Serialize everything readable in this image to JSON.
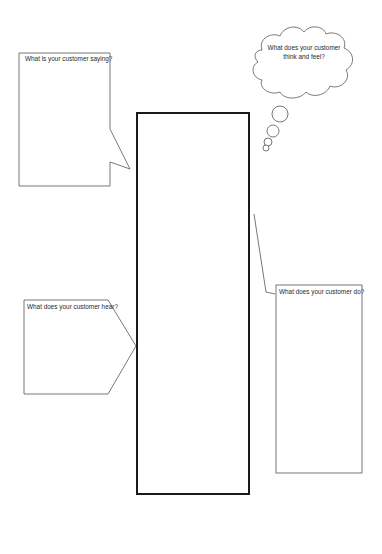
{
  "diagram": {
    "type": "empathy-map",
    "center_box": {
      "label": ""
    },
    "sections": {
      "saying": {
        "prompt": "What is your customer saying?",
        "shape": "speech-bubble"
      },
      "think_feel": {
        "prompt_line1": "What does your customer",
        "prompt_line2": "think and feel?",
        "shape": "thought-cloud"
      },
      "hear": {
        "prompt": "What does your customer hear?",
        "shape": "pentagon-arrow"
      },
      "do": {
        "prompt": "What does your customer do?",
        "shape": "callout-box"
      }
    },
    "colors": {
      "stroke": "#555555",
      "center_stroke": "#1a1a1a",
      "background": "#ffffff"
    }
  }
}
